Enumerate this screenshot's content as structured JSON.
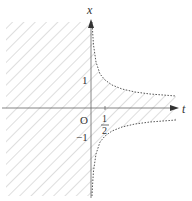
{
  "diagram": {
    "axes": {
      "horizontal_label": "t",
      "vertical_label": "x",
      "origin_label": "O"
    },
    "ticks": {
      "x_pos": "1",
      "x_neg": "−1",
      "t_num": "1",
      "t_den": "2"
    },
    "curves": "x = ±1/(2t), t > 0 (dashed boundary)",
    "shaded_region": "region with |x| < 1/(2t) for t > 0, and all t ≤ 0",
    "colors": {
      "axis": "#555555",
      "hatch": "#c8c8c8",
      "curve": "#555555",
      "text": "#333333"
    }
  }
}
